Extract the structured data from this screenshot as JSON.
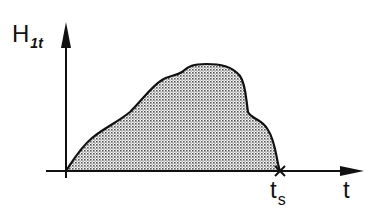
{
  "diagram": {
    "y_axis": {
      "label_main": "H",
      "label_sub": "1t"
    },
    "x_axis": {
      "label": "t"
    },
    "end_marker": {
      "label_main": "t",
      "label_sub": "s"
    },
    "colors": {
      "stroke": "#111111",
      "fill_dot": "#555555",
      "background": "#ffffff"
    }
  }
}
